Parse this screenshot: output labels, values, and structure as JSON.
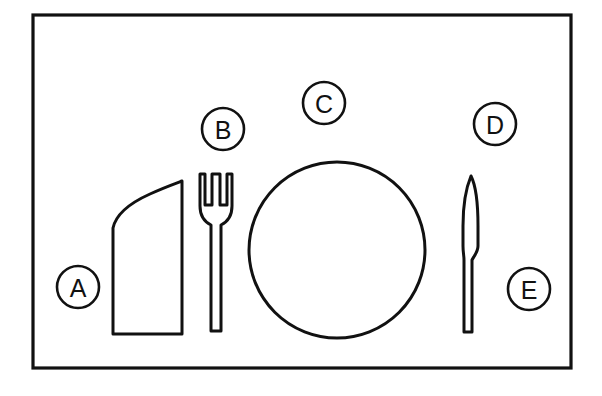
{
  "figure": {
    "background_color": "#ffffff",
    "line_color": "#111111",
    "frame": {
      "name": "placemat-frame",
      "x": 33,
      "y": 15,
      "width": 538,
      "height": 353,
      "stroke_width": 3.2
    }
  },
  "objects": [
    {
      "id": "napkin",
      "icon": "napkin-icon",
      "label_ref": "A",
      "description": "Folded napkin with slanted curved top edge",
      "bounds": {
        "x": 113,
        "y": 182,
        "width": 70,
        "height": 153
      }
    },
    {
      "id": "fork",
      "icon": "fork-icon",
      "label_ref": "B",
      "description": "Dinner fork with three tines",
      "tines": 3,
      "bounds": {
        "x": 198,
        "y": 173,
        "width": 36,
        "height": 160
      }
    },
    {
      "id": "plate",
      "icon": "plate-icon",
      "label_ref": "C",
      "description": "Round dinner plate",
      "center": {
        "x": 337,
        "y": 250
      },
      "radius": 88
    },
    {
      "id": "knife",
      "icon": "knife-icon",
      "label_ref": "D",
      "description": "Dinner knife, blade up with narrow handle",
      "bounds": {
        "x": 463,
        "y": 175,
        "width": 16,
        "height": 160
      }
    }
  ],
  "callouts": [
    {
      "id": "callout-a",
      "letter": "A",
      "cx": 78,
      "cy": 287,
      "r": 21,
      "points_to": "napkin"
    },
    {
      "id": "callout-b",
      "letter": "B",
      "cx": 223,
      "cy": 129,
      "r": 21,
      "points_to": "fork"
    },
    {
      "id": "callout-c",
      "letter": "C",
      "cx": 324,
      "cy": 103,
      "r": 21,
      "points_to": "plate"
    },
    {
      "id": "callout-d",
      "letter": "D",
      "cx": 495,
      "cy": 124,
      "r": 21,
      "points_to": "knife"
    },
    {
      "id": "callout-e",
      "letter": "E",
      "cx": 529,
      "cy": 289,
      "r": 21,
      "points_to": "placemat"
    }
  ]
}
